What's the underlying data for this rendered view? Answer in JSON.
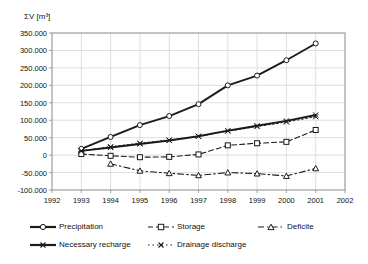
{
  "chart_data": {
    "type": "line",
    "title": "",
    "ylabel": "ΣV  [m³]",
    "xlabel": "",
    "xlim": [
      1992,
      2002
    ],
    "ylim": [
      -100000,
      350000
    ],
    "ytick_labels": [
      "350.000",
      "300.000",
      "250.000",
      "200.000",
      "150.000",
      "100.000",
      "50.000",
      "0",
      "-50.000",
      "-100.000"
    ],
    "ytick_values": [
      350000,
      300000,
      250000,
      200000,
      150000,
      100000,
      50000,
      0,
      -50000,
      -100000
    ],
    "xtick_labels": [
      "1992",
      "1993",
      "1994",
      "1995",
      "1996",
      "1997",
      "1998",
      "1999",
      "2000",
      "2001",
      "2002"
    ],
    "xtick_values": [
      1992,
      1993,
      1994,
      1995,
      1996,
      1997,
      1998,
      1999,
      2000,
      2001,
      2002
    ],
    "grid": true,
    "legend_position": "bottom",
    "x": [
      1993,
      1994,
      1995,
      1996,
      1997,
      1998,
      1999,
      2000,
      2001
    ],
    "series": [
      {
        "name": "Precipitation",
        "marker": "circle",
        "line_style": "solid",
        "color": "#1a1a1a",
        "values": [
          18000,
          52000,
          86000,
          112000,
          146000,
          200000,
          228000,
          272000,
          320000
        ]
      },
      {
        "name": "Storage",
        "marker": "square",
        "line_style": "dashed",
        "color": "#1a1a1a",
        "values": [
          3000,
          -2000,
          -6000,
          -5000,
          2000,
          28000,
          34000,
          38000,
          72000
        ]
      },
      {
        "name": "Deficite",
        "marker": "triangle",
        "line_style": "dashdot",
        "color": "#1a1a1a",
        "values": [
          null,
          -25000,
          -45000,
          -52000,
          -58000,
          -50000,
          -53000,
          -60000,
          -38000
        ]
      },
      {
        "name": "Necessary recharge",
        "marker": "cross",
        "line_style": "solid",
        "color": "#1a1a1a",
        "values": [
          12000,
          22000,
          32000,
          42000,
          54000,
          70000,
          84000,
          98000,
          115000
        ]
      },
      {
        "name": "Drainage discharge",
        "marker": "cross",
        "line_style": "dotted",
        "color": "#1a1a1a",
        "values": [
          12000,
          24000,
          34000,
          43000,
          54000,
          69000,
          82000,
          95000,
          110000
        ]
      }
    ]
  },
  "legend": {
    "items": [
      {
        "label": "Precipitation"
      },
      {
        "label": "Storage"
      },
      {
        "label": "Deficite"
      },
      {
        "label": "Necessary recharge"
      },
      {
        "label": "Drainage discharge"
      }
    ]
  }
}
